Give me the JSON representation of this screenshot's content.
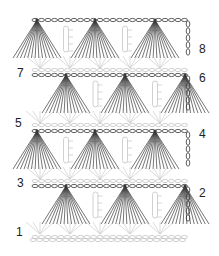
{
  "colors": {
    "dark_stitch": "#3a3a3a",
    "light_stitch": "#c4c4c4",
    "background": "#ffffff",
    "label": "#222222"
  },
  "row_labels": [
    {
      "label": "1",
      "side": "left",
      "x": 16,
      "y": 226
    },
    {
      "label": "2",
      "side": "right",
      "x": 199,
      "y": 187
    },
    {
      "label": "3",
      "side": "left",
      "x": 17,
      "y": 177
    },
    {
      "label": "4",
      "side": "right",
      "x": 199,
      "y": 128
    },
    {
      "label": "5",
      "side": "left",
      "x": 15,
      "y": 117
    },
    {
      "label": "6",
      "side": "right",
      "x": 199,
      "y": 72
    },
    {
      "label": "7",
      "side": "left",
      "x": 17,
      "y": 67
    },
    {
      "label": "8",
      "side": "right",
      "x": 199,
      "y": 43
    }
  ],
  "fan_rows": [
    {
      "row": 8,
      "top_y": 20,
      "bottom_y": 58,
      "fan_x": [
        37,
        95,
        155
      ],
      "turn_chain_side": "right"
    },
    {
      "row": 6,
      "top_y": 75,
      "bottom_y": 113,
      "fan_x": [
        66,
        125,
        185
      ],
      "turn_chain_side": "right"
    },
    {
      "row": 4,
      "top_y": 131,
      "bottom_y": 169,
      "fan_x": [
        37,
        95,
        155
      ],
      "turn_chain_side": "right"
    },
    {
      "row": 2,
      "top_y": 186,
      "bottom_y": 224,
      "fan_x": [
        66,
        125,
        185
      ],
      "turn_chain_side": "right"
    }
  ],
  "light_rows": [
    {
      "row": 7,
      "y": 70
    },
    {
      "row": 5,
      "y": 125
    },
    {
      "row": 3,
      "y": 181
    },
    {
      "row": 1,
      "y": 237
    }
  ]
}
